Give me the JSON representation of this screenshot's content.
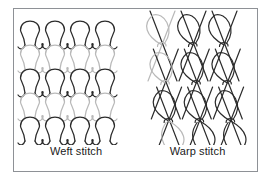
{
  "figure": {
    "background_color": "#ffffff",
    "border_color": "#8e9196",
    "panels": [
      {
        "id": "weft",
        "caption": "Weft stitch",
        "structure": "weft-knitted-loop-grid",
        "description": "Horizontal courses of interlocking needle loops forming a knitted fabric",
        "columns": 4,
        "rows": 4,
        "yarn_colors": {
          "dark": "#2b2b2b",
          "light": "#b9b9b9"
        },
        "course_shades": [
          "dark",
          "light",
          "dark",
          "light",
          "dark"
        ]
      },
      {
        "id": "warp",
        "caption": "Warp stitch",
        "structure": "warp-knitted-tricot",
        "description": "Vertical chains of teardrop loops joined by diagonal underlap legs",
        "columns": 3,
        "rows": 3,
        "yarn_colors": {
          "dark": "#2b2b2b",
          "light": "#b9b9b9"
        },
        "wale_shades": [
          "light",
          "dark",
          "dark"
        ]
      }
    ]
  }
}
